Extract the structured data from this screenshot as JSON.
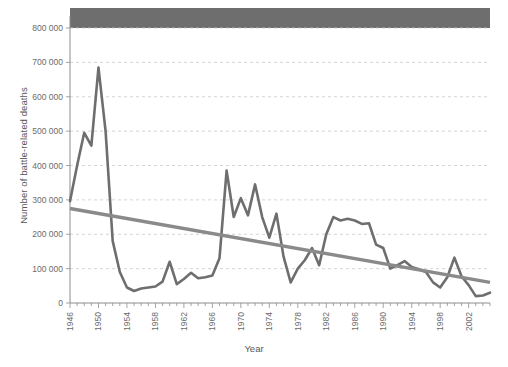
{
  "figure": {
    "masked_title_bar": true,
    "title_visible_text": ""
  },
  "axis": {
    "x_title": "Year",
    "y_title": "Number of battle-related deaths"
  },
  "colors": {
    "series_line": "#6e6e6e",
    "trend_line": "#8a8a8a",
    "grid": "#c9c9c9",
    "axis": "#8d8d8d",
    "text": "#6b6b6b",
    "mask_bar": "#6e6e6e"
  },
  "chart_data": {
    "type": "line",
    "title": "",
    "xlabel": "Year",
    "ylabel": "Number of battle-related deaths",
    "xlim": [
      1946,
      2005
    ],
    "ylim": [
      0,
      800000
    ],
    "ytick_labels": [
      "0",
      "100 000",
      "200 000",
      "300 000",
      "400 000",
      "500 000",
      "600 000",
      "700 000",
      "800 000"
    ],
    "ytick_values": [
      0,
      100000,
      200000,
      300000,
      400000,
      500000,
      600000,
      700000,
      800000
    ],
    "xtick_labels": [
      "1946",
      "1950",
      "1954",
      "1958",
      "1962",
      "1966",
      "1970",
      "1974",
      "1978",
      "1982",
      "1986",
      "1990",
      "1994",
      "1998",
      "2002"
    ],
    "xtick_values": [
      1946,
      1950,
      1954,
      1958,
      1962,
      1966,
      1970,
      1974,
      1978,
      1982,
      1986,
      1990,
      1994,
      1998,
      2002
    ],
    "minor_xticks_every": 1,
    "grid": "horizontal-dashed",
    "legend": "none",
    "x": [
      1946,
      1947,
      1948,
      1949,
      1950,
      1951,
      1952,
      1953,
      1954,
      1955,
      1956,
      1957,
      1958,
      1959,
      1960,
      1961,
      1962,
      1963,
      1964,
      1965,
      1966,
      1967,
      1968,
      1969,
      1970,
      1971,
      1972,
      1973,
      1974,
      1975,
      1976,
      1977,
      1978,
      1979,
      1980,
      1981,
      1982,
      1983,
      1984,
      1985,
      1986,
      1987,
      1988,
      1989,
      1990,
      1991,
      1992,
      1993,
      1994,
      1995,
      1996,
      1997,
      1998,
      1999,
      2000,
      2001,
      2002,
      2003,
      2004,
      2005
    ],
    "series": [
      {
        "name": "Battle-related deaths",
        "color": "#6e6e6e",
        "values": [
          296000,
          400000,
          495000,
          458000,
          685000,
          500000,
          180000,
          90000,
          45000,
          35000,
          42000,
          45000,
          48000,
          62000,
          120000,
          55000,
          70000,
          88000,
          72000,
          75000,
          80000,
          130000,
          385000,
          250000,
          305000,
          255000,
          345000,
          250000,
          190000,
          260000,
          135000,
          60000,
          100000,
          125000,
          160000,
          110000,
          200000,
          250000,
          240000,
          245000,
          240000,
          230000,
          232000,
          170000,
          160000,
          100000,
          110000,
          122000,
          105000,
          98000,
          90000,
          60000,
          45000,
          75000,
          132000,
          78000,
          52000,
          20000,
          22000,
          30000
        ]
      },
      {
        "name": "Linear trend",
        "color": "#8a8a8a",
        "type": "trend",
        "start_value": 275000,
        "end_value": 60000
      }
    ]
  }
}
